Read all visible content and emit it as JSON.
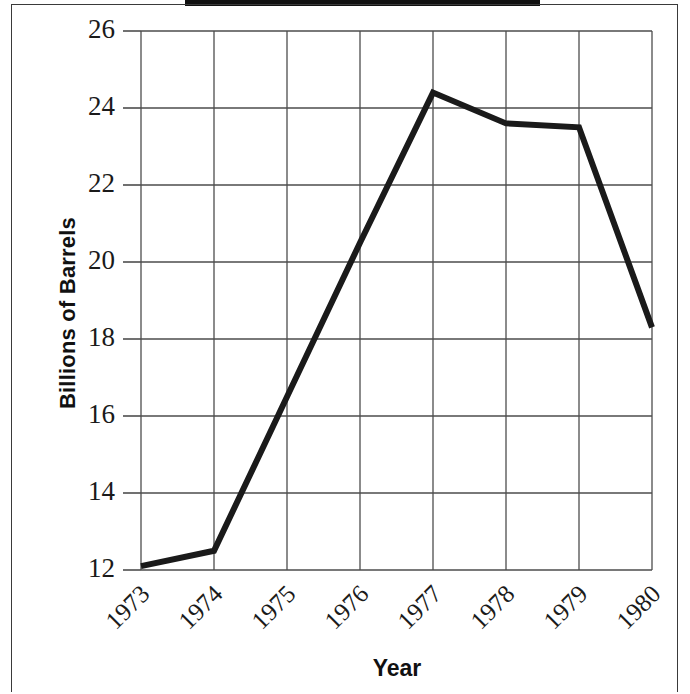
{
  "figure": {
    "scan_artifact": "black-bar-top-edge",
    "frame_color": "#3a3a3a",
    "background": "#ffffff"
  },
  "chart_data": {
    "type": "line",
    "title": "",
    "xlabel": "Year",
    "ylabel": "Billions of Barrels",
    "categories": [
      "1973",
      "1974",
      "1975",
      "1976",
      "1977",
      "1978",
      "1979",
      "1980"
    ],
    "values": [
      12.1,
      12.5,
      16.5,
      20.5,
      24.4,
      23.6,
      23.5,
      18.3
    ],
    "series": [
      {
        "name": "Billions of Barrels",
        "values": [
          12.1,
          12.5,
          16.5,
          20.5,
          24.4,
          23.6,
          23.5,
          18.3
        ],
        "color": "#1a1a1a",
        "line_width": 6
      }
    ],
    "ylim": [
      12,
      26
    ],
    "xlim": [
      "1973",
      "1980"
    ],
    "yticks": [
      12,
      14,
      16,
      18,
      20,
      22,
      24,
      26
    ],
    "ytick_labels": [
      "12",
      "14",
      "16",
      "18",
      "20",
      "22",
      "24",
      "26"
    ],
    "xtick_labels": [
      "1973",
      "1974",
      "1975",
      "1976",
      "1977",
      "1978",
      "1979",
      "1980"
    ],
    "xtick_rotation": -45,
    "grid": true,
    "grid_color": "#4d4d4d",
    "legend": false,
    "legend_position": "none",
    "markers": false
  }
}
